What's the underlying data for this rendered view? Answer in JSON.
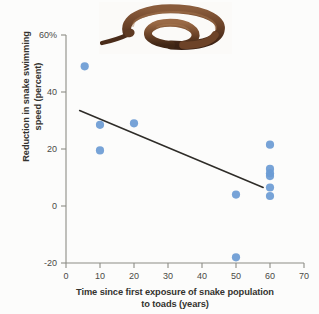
{
  "figure": {
    "background_color": "#fcfcfb",
    "point_color": "#6b9bd4",
    "axis_color": "#8c8c86",
    "trendline_color": "#2e2c28"
  },
  "photo": {
    "name": "snake-photograph",
    "alt": "Coiled brown snake",
    "body_color": "#6b4630",
    "shadow_color": "#3b2518",
    "highlight_color": "#9a6a48"
  },
  "chart_data": {
    "type": "scatter",
    "title": "",
    "xlabel": "Time since first exposure of snake population to toads (years)",
    "ylabel": "Reduction in snake swimming speed (percent)",
    "xlabel_line1": "Time since first exposure of snake population",
    "xlabel_line2": "to toads (years)",
    "ylabel_line1": "Reduction in snake swimming",
    "ylabel_line2": "speed (percent)",
    "xlim": [
      0,
      70
    ],
    "ylim": [
      -20,
      60
    ],
    "xticks": [
      0,
      10,
      20,
      30,
      40,
      50,
      60,
      70
    ],
    "xtick_labels": [
      "0",
      "10",
      "20",
      "30",
      "40",
      "50",
      "60",
      "70"
    ],
    "yticks": [
      -20,
      0,
      20,
      40,
      60
    ],
    "ytick_labels": [
      "-20",
      "0",
      "20",
      "40",
      "60%"
    ],
    "grid": false,
    "legend": "none",
    "series": [
      {
        "name": "Snake populations",
        "marker": "circle",
        "color": "#6b9bd4",
        "points": [
          {
            "x": 5.5,
            "y": 49
          },
          {
            "x": 10,
            "y": 28.5
          },
          {
            "x": 10,
            "y": 19.5
          },
          {
            "x": 20,
            "y": 29
          },
          {
            "x": 50,
            "y": 4
          },
          {
            "x": 50,
            "y": -18
          },
          {
            "x": 60,
            "y": 21.5
          },
          {
            "x": 60,
            "y": 13
          },
          {
            "x": 60,
            "y": 11.5
          },
          {
            "x": 60,
            "y": 10.5
          },
          {
            "x": 60,
            "y": 6.5
          },
          {
            "x": 60,
            "y": 3.5
          }
        ]
      }
    ],
    "trendline": {
      "name": "linear-fit",
      "color": "#2e2c28",
      "x1": 4,
      "y1": 33.5,
      "x2": 58,
      "y2": 6.5
    }
  }
}
